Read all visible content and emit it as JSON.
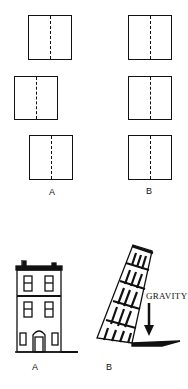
{
  "top_figure": {
    "groups": [
      {
        "label": "A",
        "boxes": [
          {
            "x": 28,
            "y": 15,
            "w": 44,
            "h": 45
          },
          {
            "x": 14,
            "y": 76,
            "w": 44,
            "h": 44
          },
          {
            "x": 29,
            "y": 135,
            "w": 44,
            "h": 45
          }
        ]
      },
      {
        "label": "B",
        "boxes": [
          {
            "x": 128,
            "y": 15,
            "w": 44,
            "h": 45
          },
          {
            "x": 128,
            "y": 76,
            "w": 44,
            "h": 44
          },
          {
            "x": 128,
            "y": 135,
            "w": 44,
            "h": 45
          }
        ]
      }
    ]
  },
  "bottom_figure": {
    "building_label": "A",
    "tower_label": "B",
    "gravity_label": "GRAVITY"
  }
}
